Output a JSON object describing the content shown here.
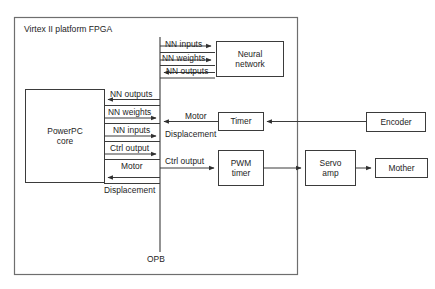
{
  "diagram": {
    "title": "Virtex II platform FPGA",
    "bus_label": "OPB",
    "blocks": {
      "powerpc": "PowerPC\ncore",
      "powerpc_line1": "PowerPC",
      "powerpc_line2": "core",
      "neural_network_line1": "Neural",
      "neural_network_line2": "network",
      "timer": "Timer",
      "pwm_timer_line1": "PWM",
      "pwm_timer_line2": "timer",
      "encoder": "Encoder",
      "servo_amp_line1": "Servo",
      "servo_amp_line2": "amp",
      "mother": "Mother"
    },
    "signals": {
      "nn_inputs_top": "NN inputs",
      "nn_weights_top": "NN weights",
      "nn_outputs_top": "NN outputs",
      "nn_outputs_left": "NN outputs",
      "nn_weights_left": "NN weights",
      "nn_inputs_left": "NN inputs",
      "ctrl_output_left": "Ctrl output",
      "motor_left": "Motor",
      "displacement_left": "Displacement",
      "motor_bus": "Motor",
      "displacement_bus": "Displacement",
      "ctrl_output_bus": "Ctrl output"
    },
    "colors": {
      "stroke": "#3b3b3b",
      "outer_stroke": "#6e6e6e",
      "text": "#1d1d1d",
      "background": "#ffffff"
    }
  }
}
